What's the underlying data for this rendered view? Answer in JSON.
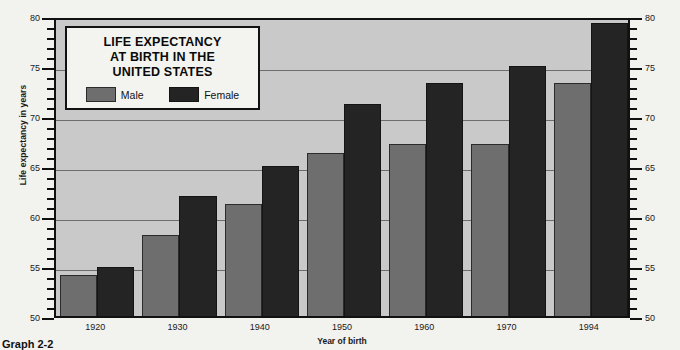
{
  "figure": {
    "caption": "Graph 2-2",
    "title_lines": [
      "LIFE EXPECTANCY",
      "AT BIRTH IN THE",
      "UNITED STATES"
    ]
  },
  "colors": {
    "male": "#6e6e6e",
    "female": "#242424",
    "plot_background": "#c9c9c9",
    "gridline": "#6d6d6d",
    "axis": "#111111",
    "card_background": "#f3f3ef"
  },
  "legend": {
    "male_label": "Male",
    "female_label": "Female"
  },
  "axes": {
    "ylabel": "Life expectancy in years",
    "xlabel": "Year of birth",
    "y_major_ticks": [
      50,
      55,
      60,
      65,
      70,
      75,
      80
    ],
    "y_min": 50,
    "y_max": 80,
    "y_minor_step": 1,
    "left_axis_labels": [
      "80",
      "75",
      "70",
      "65",
      "60",
      "55",
      "50"
    ],
    "right_axis_labels": [
      "80",
      "75",
      "70",
      "65",
      "60",
      "55",
      "50"
    ]
  },
  "chart_data": {
    "type": "bar",
    "xlabel": "Year of birth",
    "ylabel": "Life expectancy in years",
    "ylim": [
      50,
      80
    ],
    "grid": true,
    "legend_position": "inside-top-left",
    "categories": [
      "1920",
      "1930",
      "1940",
      "1950",
      "1960",
      "1970",
      "1994"
    ],
    "series": [
      {
        "name": "Male",
        "values": [
          54.1,
          58.1,
          61.2,
          66.3,
          67.2,
          67.2,
          73.3
        ]
      },
      {
        "name": "Female",
        "values": [
          54.9,
          62.0,
          65.0,
          71.2,
          73.3,
          75.0,
          79.3
        ]
      }
    ]
  }
}
